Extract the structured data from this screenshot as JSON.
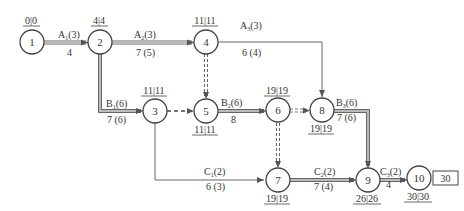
{
  "diagram": {
    "type": "network-plan",
    "nodes": [
      {
        "id": "1",
        "label": "1",
        "times": "0|0"
      },
      {
        "id": "2",
        "label": "2",
        "times": "4|4"
      },
      {
        "id": "3",
        "label": "3",
        "times": "11|11"
      },
      {
        "id": "4",
        "label": "4",
        "times": "11|11"
      },
      {
        "id": "5",
        "label": "5",
        "times": "11|11"
      },
      {
        "id": "6",
        "label": "6",
        "times": "19|19"
      },
      {
        "id": "7",
        "label": "7",
        "times": "19|19"
      },
      {
        "id": "8",
        "label": "8",
        "times": "19|19"
      },
      {
        "id": "9",
        "label": "9",
        "times": "26|26"
      },
      {
        "id": "10",
        "label": "10",
        "times": "30|30"
      }
    ],
    "final_duration": "30",
    "activities": [
      {
        "from": "1",
        "to": "2",
        "name": "A",
        "sub": "1",
        "resource": "(3)",
        "duration": "4",
        "critical": true
      },
      {
        "from": "2",
        "to": "4",
        "name": "A",
        "sub": "2",
        "resource": "(3)",
        "duration": "7 (5)",
        "critical": true
      },
      {
        "from": "4",
        "to": "8",
        "name": "A",
        "sub": "3",
        "resource": "(3)",
        "duration": "6 (4)",
        "critical": false
      },
      {
        "from": "2",
        "to": "3",
        "name": "B",
        "sub": "1",
        "resource": "(6)",
        "duration": "7 (6)",
        "critical": true
      },
      {
        "from": "5",
        "to": "6",
        "name": "B",
        "sub": "2",
        "resource": "(6)",
        "duration": "8",
        "critical": true
      },
      {
        "from": "8",
        "to": "9",
        "name": "B",
        "sub": "3",
        "resource": "(6)",
        "duration": "7 (6)",
        "critical": true
      },
      {
        "from": "3",
        "to": "7",
        "name": "C",
        "sub": "1",
        "resource": "(2)",
        "duration": "6 (3)",
        "critical": false
      },
      {
        "from": "7",
        "to": "9",
        "name": "C",
        "sub": "2",
        "resource": "(2)",
        "duration": "7 (4)",
        "critical": true
      },
      {
        "from": "9",
        "to": "10",
        "name": "C",
        "sub": "3",
        "resource": "(2)",
        "duration": "4",
        "critical": true
      }
    ],
    "dummies": [
      {
        "from": "4",
        "to": "5"
      },
      {
        "from": "3",
        "to": "5"
      },
      {
        "from": "6",
        "to": "8"
      },
      {
        "from": "6",
        "to": "7"
      }
    ],
    "colors": {
      "line": "#555555",
      "text": "#333333",
      "background": "#ffffff"
    }
  }
}
